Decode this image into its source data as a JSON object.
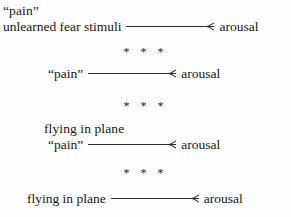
{
  "page": {
    "background_color": "#fefefe",
    "text_color": "#161616",
    "rule_color": "#2b2b2b"
  },
  "separator": {
    "glyph": "* * *",
    "count": 3
  },
  "blocks": [
    {
      "id": "block-1",
      "note": "unlearned fear stimuli with \"pain\" label above, arrow to arousal",
      "label_above": "“pain”",
      "source": "unlearned fear stimuli",
      "arrow": "→",
      "target": "arousal"
    },
    {
      "id": "block-2",
      "note": "\"pain\" alone leads to arousal",
      "label_above": "",
      "source": "“pain”",
      "arrow": "→",
      "target": "arousal"
    },
    {
      "id": "block-3",
      "note": "flying in plane paired with \"pain\" leads to arousal",
      "label_above": "flying in plane",
      "source": "“pain”",
      "arrow": "→",
      "target": "arousal"
    },
    {
      "id": "block-4",
      "note": "flying in plane alone leads to arousal",
      "label_above": "",
      "source": "flying in plane",
      "arrow": "→",
      "target": "arousal"
    }
  ]
}
